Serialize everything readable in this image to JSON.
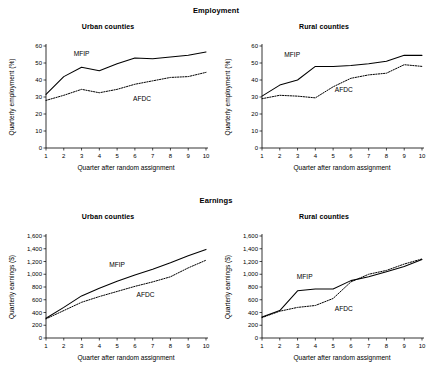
{
  "figure": {
    "sections": [
      {
        "id": "employment",
        "title": "Employment"
      },
      {
        "id": "earnings",
        "title": "Earnings"
      }
    ]
  },
  "panels": [
    {
      "id": "urban-employment",
      "title": "Urban counties",
      "ylabel": "Quarterly employment (%)",
      "xlabel": "Quarter after random assignment",
      "mfip_label": "MFIP",
      "afdc_label": "AFDC"
    },
    {
      "id": "rural-employment",
      "title": "Rural counties",
      "ylabel": "Quarterly employment (%)",
      "xlabel": "Quarter after random assignment",
      "mfip_label": "MFIP",
      "afdc_label": "AFDC"
    },
    {
      "id": "urban-earnings",
      "title": "Urban counties",
      "ylabel": "Quarterly earnings ($)",
      "xlabel": "Quarter after random assignment",
      "mfip_label": "MFIP",
      "afdc_label": "AFDC"
    },
    {
      "id": "rural-earnings",
      "title": "Rural counties",
      "ylabel": "Quarterly earnings ($)",
      "xlabel": "Quarter after random assignment",
      "mfip_label": "MFIP",
      "afdc_label": "AFDC"
    }
  ],
  "chart_data": [
    {
      "id": "urban-employment",
      "type": "line",
      "title": "Urban counties",
      "section": "Employment",
      "xlabel": "Quarter after random assignment",
      "ylabel": "Quarterly employment (%)",
      "x": [
        1,
        2,
        3,
        4,
        5,
        6,
        7,
        8,
        9,
        10
      ],
      "xticklabels": [
        "1",
        "2",
        "3",
        "4",
        "5",
        "6",
        "7",
        "8",
        "9",
        "10"
      ],
      "yticks": [
        0,
        10,
        20,
        30,
        40,
        50,
        60
      ],
      "yticklabels": [
        "0",
        "10",
        "20",
        "30",
        "40",
        "50",
        "60"
      ],
      "xlim": [
        1,
        10
      ],
      "ylim": [
        0,
        60
      ],
      "grid": false,
      "legend_position": "inline-annotation",
      "series": [
        {
          "name": "MFIP",
          "style": "solid",
          "values": [
            31.5,
            42.0,
            47.5,
            45.5,
            49.5,
            53.0,
            52.5,
            53.5,
            54.5,
            56.5
          ]
        },
        {
          "name": "AFDC",
          "style": "dotted",
          "values": [
            28.0,
            31.0,
            34.5,
            32.5,
            34.5,
            37.5,
            39.5,
            41.5,
            42.0,
            44.5
          ]
        }
      ]
    },
    {
      "id": "rural-employment",
      "type": "line",
      "title": "Rural counties",
      "section": "Employment",
      "xlabel": "Quarter after random assignment",
      "ylabel": "Quarterly employment (%)",
      "x": [
        1,
        2,
        3,
        4,
        5,
        6,
        7,
        8,
        9,
        10
      ],
      "xticklabels": [
        "1",
        "2",
        "3",
        "4",
        "5",
        "6",
        "7",
        "8",
        "9",
        "10"
      ],
      "yticks": [
        0,
        10,
        20,
        30,
        40,
        50,
        60
      ],
      "yticklabels": [
        "0",
        "10",
        "20",
        "30",
        "40",
        "50",
        "60"
      ],
      "xlim": [
        1,
        10
      ],
      "ylim": [
        0,
        60
      ],
      "grid": false,
      "legend_position": "inline-annotation",
      "series": [
        {
          "name": "MFIP",
          "style": "solid",
          "values": [
            30.5,
            37.0,
            40.0,
            48.0,
            48.0,
            48.5,
            49.5,
            51.0,
            54.5,
            54.5
          ]
        },
        {
          "name": "AFDC",
          "style": "dotted",
          "values": [
            29.0,
            31.0,
            30.5,
            29.5,
            36.0,
            41.0,
            43.0,
            44.0,
            49.0,
            48.0
          ]
        }
      ]
    },
    {
      "id": "urban-earnings",
      "type": "line",
      "title": "Urban counties",
      "section": "Earnings",
      "xlabel": "Quarter after random assignment",
      "ylabel": "Quarterly earnings ($)",
      "x": [
        1,
        2,
        3,
        4,
        5,
        6,
        7,
        8,
        9,
        10
      ],
      "xticklabels": [
        "1",
        "2",
        "3",
        "4",
        "5",
        "6",
        "7",
        "8",
        "9",
        "10"
      ],
      "yticks": [
        0,
        200,
        400,
        600,
        800,
        1000,
        1200,
        1400,
        1600
      ],
      "yticklabels": [
        "0",
        "200",
        "400",
        "600",
        "800",
        "1,000",
        "1,200",
        "1,400",
        "1,600"
      ],
      "xlim": [
        1,
        10
      ],
      "ylim": [
        0,
        1600
      ],
      "grid": false,
      "legend_position": "inline-annotation",
      "series": [
        {
          "name": "MFIP",
          "style": "solid",
          "values": [
            310,
            480,
            660,
            780,
            890,
            990,
            1080,
            1180,
            1290,
            1390
          ]
        },
        {
          "name": "AFDC",
          "style": "dotted",
          "values": [
            300,
            430,
            560,
            650,
            730,
            810,
            880,
            960,
            1100,
            1220
          ]
        }
      ]
    },
    {
      "id": "rural-earnings",
      "type": "line",
      "title": "Rural counties",
      "section": "Earnings",
      "xlabel": "Quarter after random assignment",
      "ylabel": "Quarterly earnings ($)",
      "x": [
        1,
        2,
        3,
        4,
        5,
        6,
        7,
        8,
        9,
        10
      ],
      "xticklabels": [
        "1",
        "2",
        "3",
        "4",
        "5",
        "6",
        "7",
        "8",
        "9",
        "10"
      ],
      "yticks": [
        0,
        200,
        400,
        600,
        800,
        1000,
        1200,
        1400,
        1600
      ],
      "yticklabels": [
        "0",
        "200",
        "400",
        "600",
        "800",
        "1,000",
        "1,200",
        "1,400",
        "1,600"
      ],
      "xlim": [
        1,
        10
      ],
      "ylim": [
        0,
        1600
      ],
      "grid": false,
      "legend_position": "inline-annotation",
      "series": [
        {
          "name": "MFIP",
          "style": "solid",
          "values": [
            330,
            430,
            740,
            770,
            770,
            900,
            960,
            1040,
            1120,
            1230
          ]
        },
        {
          "name": "AFDC",
          "style": "dotted",
          "values": [
            320,
            420,
            480,
            510,
            620,
            880,
            1000,
            1060,
            1160,
            1240
          ]
        }
      ]
    }
  ],
  "annotations": {
    "urban-employment": {
      "mfip": {
        "x": 3.0,
        "y": 54.0
      },
      "afdc": {
        "x": 6.4,
        "y": 27.5
      }
    },
    "rural-employment": {
      "mfip": {
        "x": 2.7,
        "y": 53.5
      },
      "afdc": {
        "x": 5.6,
        "y": 33.0
      }
    },
    "urban-earnings": {
      "mfip": {
        "x": 5.0,
        "y": 1110
      },
      "afdc": {
        "x": 6.6,
        "y": 640
      }
    },
    "rural-earnings": {
      "mfip": {
        "x": 3.4,
        "y": 920
      },
      "afdc": {
        "x": 5.6,
        "y": 430
      }
    }
  },
  "colors": {
    "axis": "#000000",
    "mfip_line": "#000000",
    "afdc_line": "#000000",
    "background": "#ffffff"
  }
}
